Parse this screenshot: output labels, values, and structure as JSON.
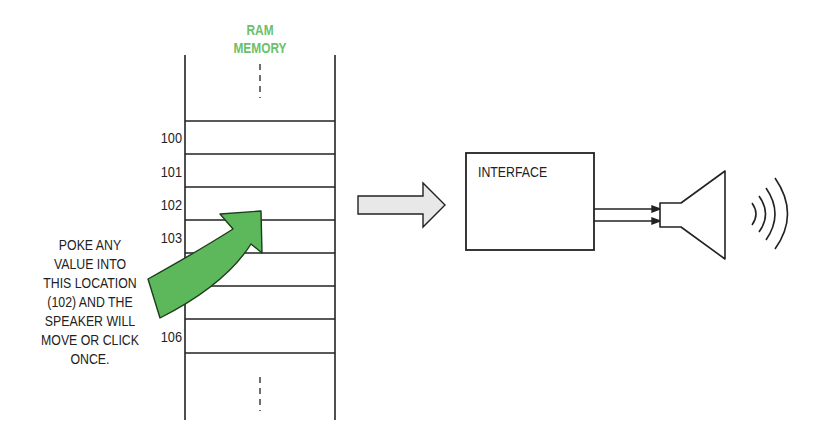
{
  "diagram": {
    "memory": {
      "title_line1": "RAM",
      "title_line2": "MEMORY",
      "title_color": "#6cc06a",
      "addresses": [
        {
          "label": "100",
          "y": 138
        },
        {
          "label": "101",
          "y": 172
        },
        {
          "label": "102",
          "y": 205
        },
        {
          "label": "103",
          "y": 238
        },
        {
          "label": "106",
          "y": 337
        }
      ]
    },
    "annotation": {
      "lines": [
        "POKE ANY",
        "VALUE INTO",
        "THIS LOCATION",
        "(102) AND THE",
        "SPEAKER WILL",
        "MOVE OR CLICK",
        "ONCE."
      ],
      "arrow_color": "#5cb85a"
    },
    "interface": {
      "label": "INTERFACE"
    },
    "speaker": {
      "icon": "speaker-icon",
      "waves_icon": "sound-waves-icon"
    }
  }
}
